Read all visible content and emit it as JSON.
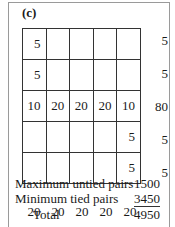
{
  "panel_label": "(c)",
  "grid": [
    [
      "5",
      "",
      "",
      "",
      ""
    ],
    [
      "5",
      "",
      "",
      "",
      ""
    ],
    [
      "10",
      "20",
      "20",
      "20",
      "10"
    ],
    [
      "",
      "",
      "",
      "",
      "5"
    ],
    [
      "",
      "",
      "",
      "",
      "5"
    ]
  ],
  "row_totals": [
    "5",
    "5",
    "80",
    "5",
    "5"
  ],
  "column_totals": [
    "20",
    "20",
    "20",
    "20",
    "20"
  ],
  "summary": [
    {
      "label": "Maximum untied pairs",
      "value": "1500"
    },
    {
      "label": "Minimum tied pairs",
      "value": "3450"
    },
    {
      "label": "Total",
      "value": "4950"
    }
  ]
}
